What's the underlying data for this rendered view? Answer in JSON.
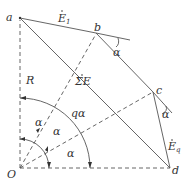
{
  "diagram": {
    "points": {
      "a": "a",
      "b": "b",
      "c": "c",
      "d": "d",
      "O": "O"
    },
    "labels": {
      "E1": "E",
      "E1_sub": "1",
      "Eq": "E",
      "Eq_sub": "q",
      "sumE": "ΣE",
      "R": "R",
      "alpha": "α",
      "q_alpha": "qα"
    }
  }
}
